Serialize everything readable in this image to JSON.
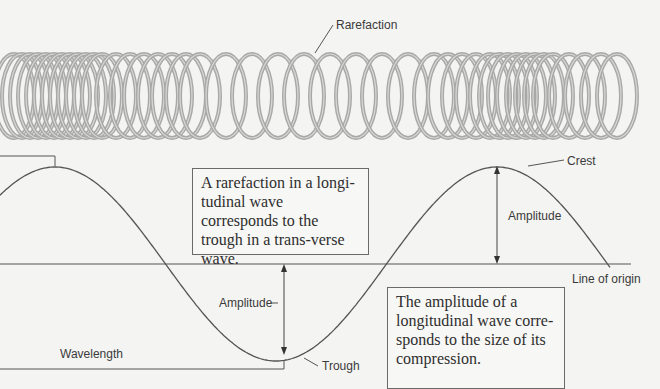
{
  "labels": {
    "rarefaction": "Rarefaction",
    "crest": "Crest",
    "amplitude_upper": "Amplitude",
    "amplitude_lower": "Amplitude",
    "line_of_origin": "Line of origin",
    "wavelength": "Wavelength",
    "trough": "Trough"
  },
  "callouts": {
    "rarefaction": "A rarefaction in a longi-tudinal wave corresponds to the trough in a trans-verse wave.",
    "amplitude": "The amplitude of a longitudinal wave corre-sponds to the size of its compression."
  },
  "colors": {
    "background": "#f4f4f2",
    "line": "#555555",
    "spring": "#a8a8a6",
    "spring_highlight": "#d8d8d6",
    "text": "#3a3a3a"
  }
}
